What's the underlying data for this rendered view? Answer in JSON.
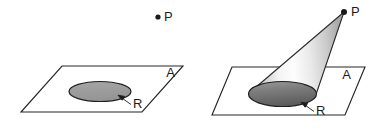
{
  "figure": {
    "canvas": {
      "width": 385,
      "height": 131,
      "background": "#ffffff"
    },
    "panels": [
      {
        "id": "left",
        "caption": "",
        "plane": {
          "label": "A",
          "label_x": 175,
          "label_y": 77,
          "points": "62,66 183,66 142,112 21,112",
          "stroke": "#262626"
        },
        "region": {
          "label": "R",
          "label_x": 133,
          "label_y": 107,
          "cx": 100,
          "cy": 91.5,
          "rx": 31,
          "ry": 10,
          "fill": "#9d9d9d",
          "stroke": "#1f1f1f"
        },
        "apex": {
          "label": "P",
          "label_x": 164,
          "label_y": 21,
          "dot_x": 158,
          "dot_y": 17,
          "dot_r": 2.6
        },
        "arrow": {
          "from_x": 131,
          "from_y": 104,
          "to_x": 119,
          "to_y": 96
        },
        "has_cone": false
      },
      {
        "id": "right",
        "caption": "",
        "plane": {
          "label": "A",
          "label_x": 347,
          "label_y": 78,
          "points": "232,67 365,67 345,115 212,115",
          "stroke": "#262626"
        },
        "region": {
          "label": "R",
          "label_x": 316,
          "label_y": 114,
          "cx": 282,
          "cy": 94,
          "rx": 34,
          "ry": 12.5,
          "fill": "#6e6e6e",
          "stroke": "#1f1f1f"
        },
        "apex": {
          "label": "P",
          "label_x": 353,
          "label_y": 15,
          "dot_x": 344,
          "dot_y": 12,
          "dot_r": 3.0
        },
        "arrow": {
          "from_x": 314,
          "from_y": 111,
          "to_x": 302,
          "to_y": 103
        },
        "has_cone": true,
        "cone": {
          "apex_x": 344,
          "apex_y": 12,
          "left_tangent_x": 248,
          "left_tangent_y": 94,
          "right_tangent_x": 316,
          "right_tangent_y": 94,
          "fill_light": "#fbfbfb",
          "fill_mid": "#d7d7d7",
          "fill_dark": "#9a9a9a",
          "stroke": "#2b2b2b"
        }
      }
    ],
    "colors": {
      "line": "#262626",
      "region_flat": "#9d9d9d",
      "region_cone_base": "#6e6e6e",
      "cone_light": "#fbfbfb",
      "cone_dark": "#9a9a9a",
      "text": "#1c1c1c",
      "background": "#ffffff"
    },
    "labels": {
      "plane_label": "A",
      "region_label": "R",
      "point_label": "P"
    }
  }
}
